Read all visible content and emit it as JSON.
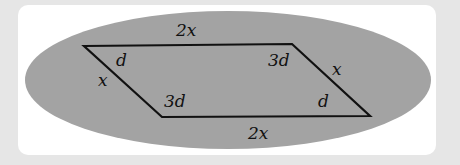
{
  "diagram": {
    "shape": "parallelogram",
    "colors": {
      "background": "#e6e6e6",
      "card": "#ffffff",
      "ellipse": "#a3a3a3",
      "stroke": "#111111"
    },
    "labels": {
      "top_side": "2x",
      "bottom_side": "2x",
      "left_side": "x",
      "right_side": "x",
      "top_left_angle": "d",
      "top_right_angle": "3d",
      "bottom_left_angle": "3d",
      "bottom_right_angle": "d"
    }
  }
}
